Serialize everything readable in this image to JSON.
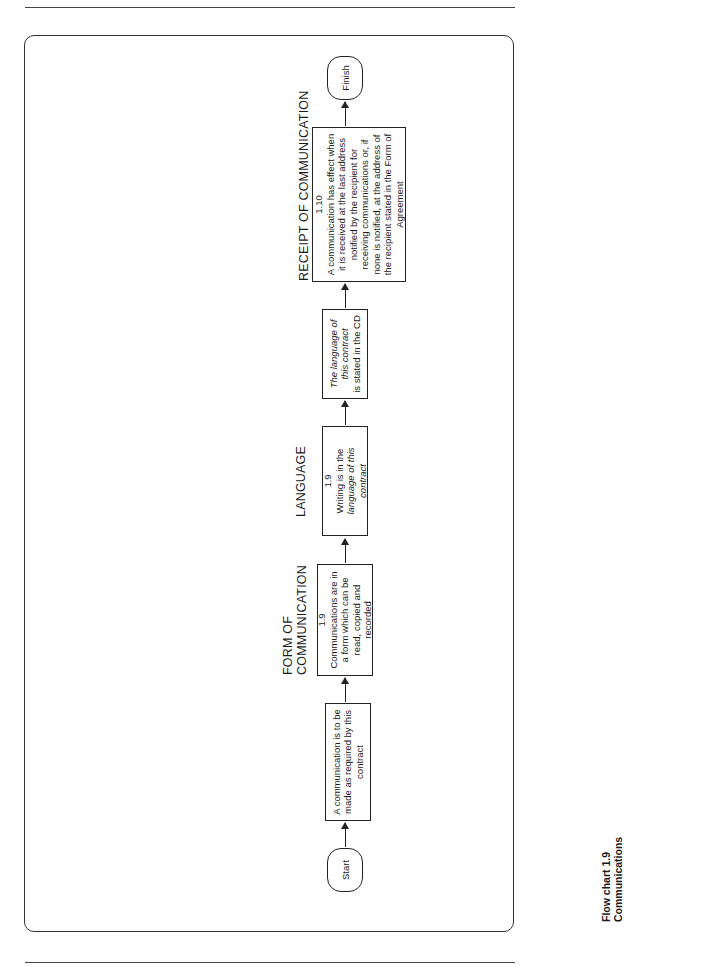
{
  "page": {
    "caption_line1": "Flow chart 1.9",
    "caption_line2": "Communications"
  },
  "flow": {
    "start": {
      "label": "Start"
    },
    "step1": {
      "text": "A communication is to be made as required by this contract"
    },
    "step2": {
      "heading_line1": "FORM OF",
      "heading_line2": "COMMUNICATION",
      "clause": "1.9",
      "text": "Communications are in a form which can be read, copied and recorded"
    },
    "step3": {
      "heading": "LANGUAGE",
      "clause": "1.9",
      "text_plain": "Writing is in the",
      "text_italic": "language of this contract"
    },
    "step4": {
      "text_italic": "The language of this contract",
      "text_plain": "is stated in the CD"
    },
    "step5": {
      "heading": "RECEIPT OF COMMUNICATION",
      "clause": "1.10",
      "text": "A communication has effect when it is received at the last address notified by the recipient for receiving communications or, if none is notified, at the address of the recipient stated in the Form of Agreement"
    },
    "finish": {
      "label": "Finish"
    }
  }
}
